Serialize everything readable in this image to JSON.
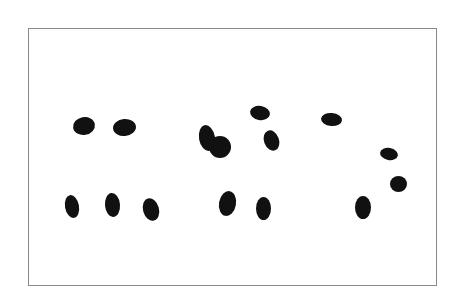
{
  "image": {
    "description": "Black ink blots (chromosome-like spots) on white card inside thin gray frame",
    "frame_color": "#8a8a8a",
    "blob_color": "#111111",
    "background": "#ffffff"
  },
  "blobs": [
    {
      "x": 73,
      "y": 117,
      "w": 22,
      "h": 18,
      "r": -10
    },
    {
      "x": 113,
      "y": 119,
      "w": 23,
      "h": 17,
      "r": -5
    },
    {
      "x": 199,
      "y": 125,
      "w": 16,
      "h": 26,
      "r": -10
    },
    {
      "x": 209,
      "y": 136,
      "w": 22,
      "h": 22,
      "r": 0
    },
    {
      "x": 250,
      "y": 106,
      "w": 20,
      "h": 14,
      "r": 10
    },
    {
      "x": 264,
      "y": 130,
      "w": 15,
      "h": 21,
      "r": -20
    },
    {
      "x": 321,
      "y": 113,
      "w": 21,
      "h": 13,
      "r": 5
    },
    {
      "x": 380,
      "y": 148,
      "w": 18,
      "h": 12,
      "r": 10
    },
    {
      "x": 390,
      "y": 176,
      "w": 17,
      "h": 16,
      "r": 0
    },
    {
      "x": 65,
      "y": 195,
      "w": 14,
      "h": 23,
      "r": -10
    },
    {
      "x": 105,
      "y": 193,
      "w": 15,
      "h": 24,
      "r": -5
    },
    {
      "x": 143,
      "y": 198,
      "w": 16,
      "h": 23,
      "r": -15
    },
    {
      "x": 219,
      "y": 191,
      "w": 17,
      "h": 25,
      "r": 10
    },
    {
      "x": 256,
      "y": 197,
      "w": 15,
      "h": 23,
      "r": 0
    },
    {
      "x": 355,
      "y": 196,
      "w": 16,
      "h": 23,
      "r": 0
    }
  ]
}
